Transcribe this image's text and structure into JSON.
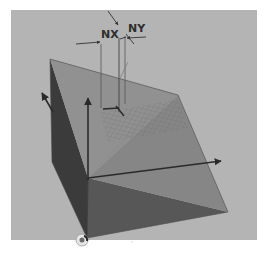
{
  "figure": {
    "type": "3d-diagram",
    "labels": {
      "nx": "NX",
      "ny": "NY"
    },
    "colors": {
      "page_background": "#ffffff",
      "panel_background": "#b4b4b4",
      "plane_top": "#8e8e8e",
      "plane_front": "#7a7a7a",
      "left_face": "#3a3a3a",
      "bottom_face": "#555555",
      "axis": "#2a2a2a",
      "grid": "#6e6e6e"
    },
    "elements": [
      "inclined-plane",
      "left-triangular-face",
      "bottom-shadow-face",
      "z-axis-arrow",
      "x-axis-arrow",
      "y-axis-arrow",
      "grid-patch",
      "normal-vector",
      "nx-dimension-arrows",
      "ny-dimension-arrows",
      "origin-marker"
    ]
  }
}
